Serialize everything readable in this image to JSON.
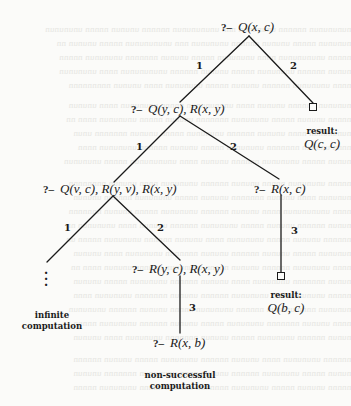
{
  "diagram": {
    "type": "SLD-tree",
    "nodes": {
      "root": {
        "prefix": "?–",
        "goal": "Q(x, c)"
      },
      "n1": {
        "prefix": "?–",
        "goal": "Q(y, c), R(x, y)"
      },
      "n2": {
        "prefix": "?–",
        "goal": "Q(v, c), R(y, v), R(x, y)"
      },
      "n3": {
        "prefix": "?–",
        "goal": "R(x, c)"
      },
      "n4": {
        "prefix": "?–",
        "goal": "R(y, c), R(x, y)"
      },
      "n5": {
        "prefix": "?–",
        "goal": "R(x, b)"
      }
    },
    "edges": [
      {
        "from": "root",
        "to": "n1",
        "label": "1"
      },
      {
        "from": "root",
        "to": "success1",
        "label": "2"
      },
      {
        "from": "n1",
        "to": "n2",
        "label": "1"
      },
      {
        "from": "n1",
        "to": "n3",
        "label": "2"
      },
      {
        "from": "n2",
        "to": "infinite",
        "label": "1"
      },
      {
        "from": "n2",
        "to": "n4",
        "label": "2"
      },
      {
        "from": "n3",
        "to": "success2",
        "label": "3"
      },
      {
        "from": "n4",
        "to": "n5",
        "label": "3"
      }
    ],
    "leaves": {
      "success1": {
        "symbol": "□",
        "caption": "result:",
        "value": "Q(c, c)"
      },
      "success2": {
        "symbol": "□",
        "caption": "result:",
        "value": "Q(b, c)"
      },
      "infinite": {
        "symbol": "⋮",
        "caption_line1": "infinite",
        "caption_line2": "computation"
      },
      "failure": {
        "caption_line1": "non-successful",
        "caption_line2": "computation"
      }
    }
  }
}
